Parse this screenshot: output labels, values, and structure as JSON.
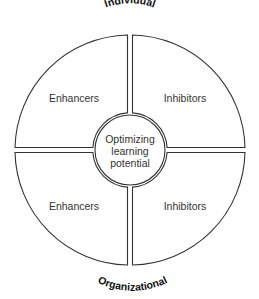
{
  "diagram": {
    "top_label": "Individual",
    "bottom_label": "Organizational",
    "center": {
      "line1": "Optimizing",
      "line2": "learning",
      "line3": "potential"
    },
    "quadrants": [
      {
        "position": "top-left",
        "label": "Enhancers"
      },
      {
        "position": "top-right",
        "label": "Inhibitors"
      },
      {
        "position": "bottom-left",
        "label": "Enhancers"
      },
      {
        "position": "bottom-right",
        "label": "Inhibitors"
      }
    ],
    "colors": {
      "stroke": "#333333",
      "fill": "#ffffff",
      "text": "#333333"
    }
  }
}
